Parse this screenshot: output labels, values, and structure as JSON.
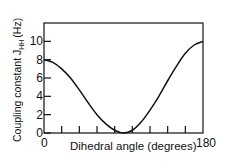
{
  "chart_data": {
    "type": "line",
    "title": "",
    "xlabel": "Dihedral angle (degrees)",
    "ylabel": "Coupling constant J_HH (Hz)",
    "ylabel_main": "Coupling constant J",
    "ylabel_sub": "HH",
    "ylabel_unit": "(Hz)",
    "xlim": [
      0,
      180
    ],
    "ylim": [
      0,
      12
    ],
    "x_tick_labels": [
      "0",
      "180"
    ],
    "x_minor_ticks": [
      20,
      40,
      60,
      80,
      100,
      120,
      140,
      160
    ],
    "y_tick_labels": [
      "0",
      "2",
      "4",
      "6",
      "8",
      "10"
    ],
    "grid": false,
    "legend": null,
    "series": [
      {
        "name": "Karplus curve",
        "x": [
          0,
          10,
          20,
          30,
          40,
          50,
          60,
          70,
          80,
          90,
          100,
          110,
          120,
          130,
          140,
          150,
          160,
          170,
          180
        ],
        "values": [
          8.0,
          7.7,
          7.0,
          6.0,
          4.7,
          3.3,
          2.0,
          1.0,
          0.3,
          0.0,
          0.3,
          1.2,
          2.5,
          4.0,
          5.7,
          7.3,
          8.7,
          9.6,
          10.0
        ]
      }
    ]
  }
}
